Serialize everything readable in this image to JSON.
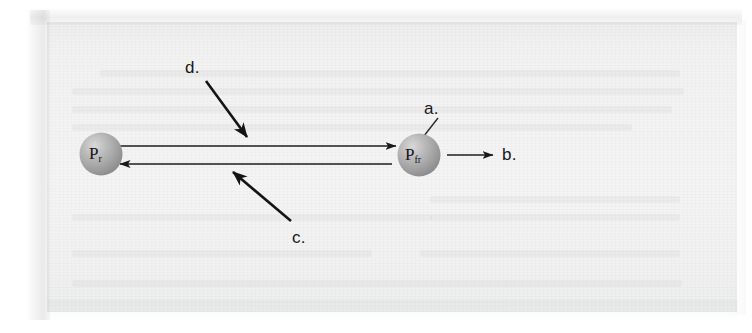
{
  "figure": {
    "type": "diagram",
    "background_color": "#f3f3f4",
    "ink_color": "#1a1a1c",
    "sphere_color": "#a8a8a8"
  },
  "nodes": [
    {
      "id": "left-sphere",
      "label_base": "P",
      "label_sub": "r",
      "cx": 101,
      "cy": 154,
      "r": 22
    },
    {
      "id": "right-sphere",
      "label_base": "P",
      "label_sub": "fr",
      "cx": 419,
      "cy": 155,
      "r": 22
    }
  ],
  "connectors": [
    {
      "id": "top-arrow",
      "from": "left-sphere",
      "to": "right-sphere",
      "direction": "right",
      "x1": 118,
      "x2": 396,
      "y": 146
    },
    {
      "id": "bottom-arrow",
      "from": "right-sphere",
      "to": "left-sphere",
      "direction": "left",
      "x1": 392,
      "x2": 120,
      "y": 164
    },
    {
      "id": "output-arrow",
      "from": "right-sphere",
      "to": "b-label",
      "direction": "right",
      "x1": 447,
      "x2": 495,
      "y": 155
    }
  ],
  "callouts": [
    {
      "id": "callout-a",
      "label": "a.",
      "label_x": 424,
      "label_y": 99,
      "leader": {
        "x1": 438,
        "y1": 119,
        "x2": 419,
        "y2": 140
      },
      "leader_style": "plain-line",
      "target": "right-sphere"
    },
    {
      "id": "callout-b",
      "label": "b.",
      "label_x": 502,
      "label_y": 145,
      "leader": null,
      "leader_style": "none",
      "target": "output-arrow"
    },
    {
      "id": "callout-c",
      "label": "c.",
      "label_x": 292,
      "label_y": 228,
      "leader": {
        "x1": 290,
        "y1": 222,
        "x2": 230,
        "y2": 170
      },
      "leader_style": "arrow",
      "target": "bottom-arrow"
    },
    {
      "id": "callout-d",
      "label": "d.",
      "label_x": 185,
      "label_y": 58,
      "leader": {
        "x1": 206,
        "y1": 81,
        "x2": 250,
        "y2": 140
      },
      "leader_style": "arrow",
      "target": "top-arrow"
    }
  ],
  "ghost_text_rows": [
    {
      "x": 100,
      "y": 70,
      "w": 580
    },
    {
      "x": 72,
      "y": 88,
      "w": 612
    },
    {
      "x": 72,
      "y": 106,
      "w": 600
    },
    {
      "x": 72,
      "y": 124,
      "w": 560
    },
    {
      "x": 430,
      "y": 196,
      "w": 250
    },
    {
      "x": 72,
      "y": 214,
      "w": 360
    },
    {
      "x": 430,
      "y": 214,
      "w": 250
    },
    {
      "x": 72,
      "y": 250,
      "w": 300
    },
    {
      "x": 420,
      "y": 250,
      "w": 260
    },
    {
      "x": 72,
      "y": 280,
      "w": 610
    }
  ]
}
